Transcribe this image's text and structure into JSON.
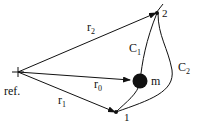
{
  "diagram": {
    "reference_label": "ref.",
    "vectors": [
      {
        "id": "r0",
        "label": "r",
        "sub": "0",
        "from": "ref",
        "to": "m"
      },
      {
        "id": "r1",
        "label": "r",
        "sub": "1",
        "from": "ref",
        "to": "1"
      },
      {
        "id": "r2",
        "label": "r",
        "sub": "2",
        "from": "ref",
        "to": "2"
      }
    ],
    "points": [
      {
        "id": "1",
        "label": "1"
      },
      {
        "id": "2",
        "label": "2"
      }
    ],
    "mass": {
      "label": "m"
    },
    "paths": [
      {
        "id": "C1",
        "label": "C",
        "sub": "1"
      },
      {
        "id": "C2",
        "label": "C",
        "sub": "2"
      }
    ],
    "colors": {
      "ink": "#111111",
      "background": "#ffffff"
    }
  }
}
